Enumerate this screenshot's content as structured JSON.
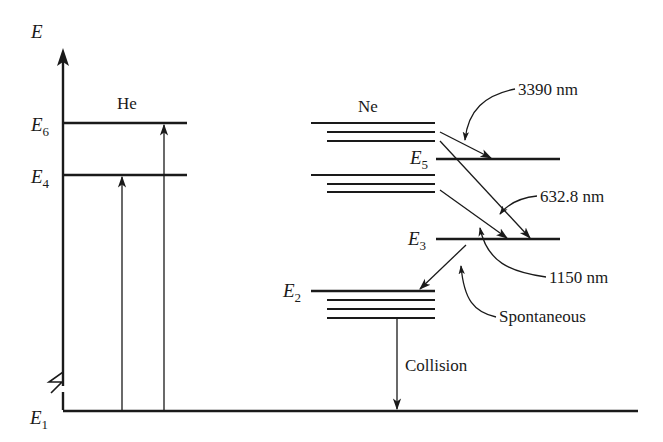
{
  "diagram": {
    "type": "energy-level diagram (He-Ne laser)",
    "axis": {
      "label": "E"
    },
    "levels": {
      "E1": {
        "main": "E",
        "sub": "1"
      },
      "E2": {
        "main": "E",
        "sub": "2"
      },
      "E3": {
        "main": "E",
        "sub": "3"
      },
      "E4": {
        "main": "E",
        "sub": "4"
      },
      "E5": {
        "main": "E",
        "sub": "5"
      },
      "E6": {
        "main": "E",
        "sub": "6"
      }
    },
    "atoms": {
      "helium": "He",
      "neon": "Ne"
    },
    "transitions": {
      "t3390": "3390 nm",
      "t632": "632.8 nm",
      "t1150": "1150 nm",
      "spontaneous": "Spontaneous",
      "collision": "Collision"
    },
    "colors": {
      "ink": "#1a1a1a",
      "background": "#ffffff"
    }
  }
}
